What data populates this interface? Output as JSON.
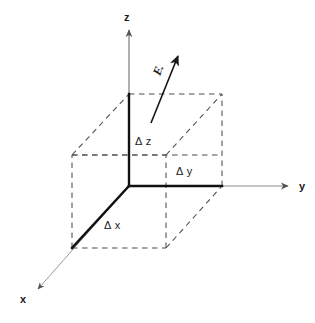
{
  "figure": {
    "background_color": "#ffffff",
    "ink_color": "#1a1a1a",
    "axis_color": "#7a7a7a",
    "dashed_color": "#555555"
  },
  "axes": [
    {
      "name": "z-axis",
      "label": "z",
      "direction": "up"
    },
    {
      "name": "y-axis",
      "label": "y",
      "direction": "right"
    },
    {
      "name": "x-axis",
      "label": "x",
      "direction": "down-left"
    }
  ],
  "edges": [
    {
      "name": "delta-x-edge",
      "label": "Δ x"
    },
    {
      "name": "delta-y-edge",
      "label": "Δ y"
    },
    {
      "name": "delta-z-edge",
      "label": "Δ z"
    }
  ],
  "vector": {
    "name": "flux-vector",
    "label": "F",
    "notation": "vector-arrow-overbar"
  },
  "labels": {
    "z": "z",
    "y": "y",
    "x": "x",
    "delta_x": "Δ x",
    "delta_y": "Δ y",
    "delta_z": "Δ z",
    "vector": "F"
  }
}
